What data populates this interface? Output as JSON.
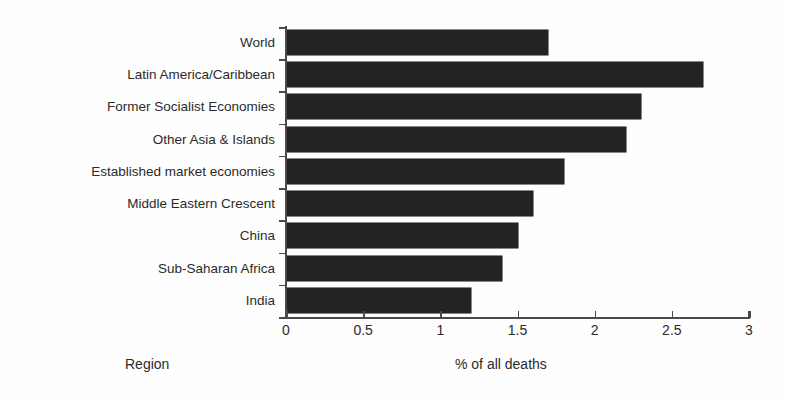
{
  "chart_data": {
    "type": "bar",
    "orientation": "horizontal",
    "title": "",
    "xlabel": "% of all deaths",
    "ylabel": "Region",
    "xlim": [
      0,
      3
    ],
    "xticks": [
      "0",
      "0.5",
      "1",
      "1.5",
      "2",
      "2.5",
      "3"
    ],
    "xtick_values": [
      0,
      0.5,
      1,
      1.5,
      2,
      2.5,
      3
    ],
    "grid": false,
    "legend": false,
    "bar_color": "#232323",
    "axis_color": "#4a4a4a",
    "background_color": "#fefefe",
    "categories": [
      "World",
      "Latin America/Caribbean",
      "Former Socialist Economies",
      "Other Asia & Islands",
      "Established market economies",
      "Middle Eastern Crescent",
      "China",
      "Sub-Saharan Africa",
      "India"
    ],
    "values": [
      1.7,
      2.7,
      2.3,
      2.2,
      1.8,
      1.6,
      1.5,
      1.4,
      1.2
    ]
  }
}
